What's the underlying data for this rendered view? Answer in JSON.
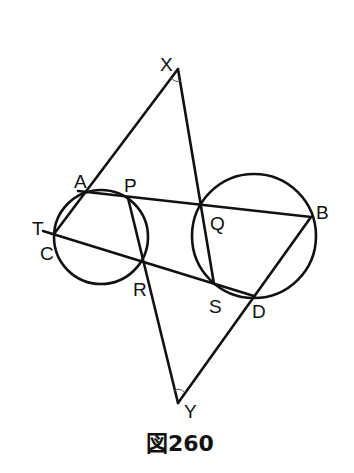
{
  "caption": "図260",
  "colors": {
    "stroke": "#111111",
    "background": "#ffffff"
  },
  "points": {
    "X": {
      "label": "X",
      "x": 178,
      "y": 69
    },
    "A": {
      "label": "A",
      "x": 87,
      "y": 192
    },
    "P": {
      "label": "P",
      "x": 128,
      "y": 198
    },
    "Q": {
      "label": "Q",
      "x": 201,
      "y": 204
    },
    "B": {
      "label": "B",
      "x": 311,
      "y": 217
    },
    "T": {
      "label": "T",
      "x": 43,
      "y": 231
    },
    "C": {
      "label": "C",
      "x": 54,
      "y": 234
    },
    "R": {
      "label": "R",
      "x": 143,
      "y": 262
    },
    "S": {
      "label": "S",
      "x": 214,
      "y": 284
    },
    "D": {
      "label": "D",
      "x": 254,
      "y": 296
    },
    "Y": {
      "label": "Y",
      "x": 178,
      "y": 403
    }
  },
  "circles": [
    {
      "name": "small-circle",
      "through": [
        "A",
        "P",
        "C",
        "R"
      ],
      "cx": 101,
      "cy": 237,
      "r": 47
    },
    {
      "name": "large-circle",
      "through": [
        "Q",
        "B",
        "S",
        "D"
      ],
      "cx": 254,
      "cy": 236,
      "r": 62
    }
  ],
  "segments": [
    [
      "X",
      "A",
      "C"
    ],
    [
      "X",
      "Q",
      "S"
    ],
    [
      "A",
      "P",
      "Q",
      "B"
    ],
    [
      "T",
      "C",
      "R",
      "S",
      "D"
    ],
    [
      "P",
      "R",
      "Y"
    ],
    [
      "B",
      "D",
      "Y"
    ]
  ],
  "angle_marks": [
    "X",
    "Y"
  ]
}
